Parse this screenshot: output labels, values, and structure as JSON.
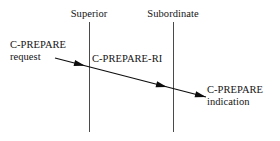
{
  "diagram": {
    "type": "sequence-diagram",
    "width": 280,
    "height": 141,
    "background_color": "#ffffff",
    "line_color": "#4a4a4a",
    "arrow_color": "#0d0d0d",
    "text_color": "#141414"
  },
  "lifelines": [
    {
      "id": "superior",
      "title": "Superior",
      "x": 89,
      "top": 22,
      "bottom": 132
    },
    {
      "id": "subordinate",
      "title": "Subordinate",
      "x": 173,
      "top": 22,
      "bottom": 132
    }
  ],
  "messages": [
    {
      "id": "c-prepare-request",
      "label_line1": "C-PREPARE",
      "label_line2": "request",
      "position": "left",
      "x": 10,
      "y": 39
    },
    {
      "id": "c-prepare-ri",
      "label_line1": "C-PREPARE-RI",
      "label_line2": "",
      "position": "middle",
      "x": 92,
      "y": 53
    },
    {
      "id": "c-prepare-indication",
      "label_line1": "C-PREPARE",
      "label_line2": "indication",
      "position": "right",
      "x": 207,
      "y": 84
    }
  ],
  "arrow": {
    "id": "c-prepare-flow",
    "start_x": 55,
    "start_y": 58,
    "end_x": 206,
    "end_y": 97,
    "arrowheads_at_x": [
      85,
      167,
      206
    ],
    "stroke_width": 1.2
  }
}
